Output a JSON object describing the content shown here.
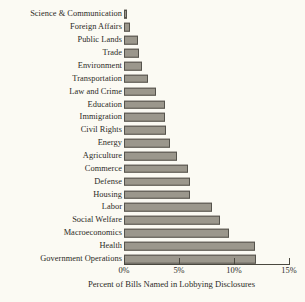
{
  "chart_data": {
    "type": "bar",
    "orientation": "horizontal",
    "title": "",
    "subtitle": "",
    "xlabel": "Percent of Bills Named in Lobbying Disclosures",
    "ylabel": "",
    "xlim": [
      0,
      15
    ],
    "grid": false,
    "legend": null,
    "xticks": [
      0,
      5,
      10,
      15
    ],
    "xticklabels": [
      "0%",
      "5%",
      "10%",
      "15%"
    ],
    "categories": [
      "Science & Communication",
      "Foreign Affairs",
      "Public Lands",
      "Trade",
      "Environment",
      "Transportation",
      "Law and Crime",
      "Education",
      "Immigration",
      "Civil Rights",
      "Energy",
      "Agriculture",
      "Commerce",
      "Defense",
      "Housing",
      "Labor",
      "Social Welfare",
      "Macroeconomics",
      "Health",
      "Government Operations"
    ],
    "values": [
      0.3,
      0.5,
      1.3,
      1.4,
      1.6,
      2.2,
      2.9,
      3.7,
      3.7,
      3.8,
      4.2,
      4.8,
      5.8,
      6.0,
      6.0,
      8.0,
      8.7,
      9.5,
      11.9,
      12.0
    ],
    "value_unit": "percent",
    "colors": {
      "background": "#fbfaf3",
      "bar_fill": "#9b978c",
      "bar_edge": "#55534c",
      "text": "#2b2a26",
      "axis": "#4a483f"
    }
  }
}
